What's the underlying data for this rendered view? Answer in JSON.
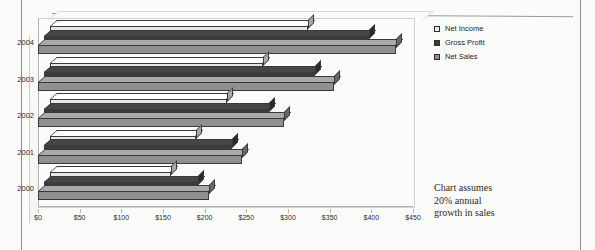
{
  "page": {
    "background_color": "#fbfbfa",
    "border_color": "#8a8a8a"
  },
  "note": {
    "line1": "Chart assumes",
    "line2": "20% annual",
    "line3": "growth in sales"
  },
  "legend": {
    "position": "top-right",
    "items": [
      {
        "label": "Net Income",
        "color": "#e8e8e8"
      },
      {
        "label": "Gross Profit",
        "color": "#3b3b3b"
      },
      {
        "label": "Net Sales",
        "color": "#8f8f8f"
      }
    ]
  },
  "chart_data": {
    "type": "bar",
    "orientation": "horizontal",
    "style": "3d",
    "title": "",
    "subtitle": "",
    "xlabel": "",
    "ylabel": "",
    "categories": [
      "2000",
      "2001",
      "2002",
      "2003",
      "2004"
    ],
    "series": [
      {
        "name": "Net Income",
        "color": "#e8e8e8",
        "values": [
          145,
          175,
          212,
          255,
          310
        ]
      },
      {
        "name": "Gross Profit",
        "color": "#3b3b3b",
        "values": [
          185,
          225,
          270,
          325,
          390
        ]
      },
      {
        "name": "Net Sales",
        "color": "#8f8f8f",
        "values": [
          205,
          245,
          295,
          355,
          430
        ]
      }
    ],
    "xlim": [
      0,
      450
    ],
    "xtick_values": [
      0,
      50,
      100,
      150,
      200,
      250,
      300,
      350,
      400,
      450
    ],
    "xtick_labels": [
      "$0",
      "$50",
      "$100",
      "$150",
      "$200",
      "$250",
      "$300",
      "$350",
      "$400",
      "$450"
    ],
    "grid": false,
    "annotations": [
      "Chart assumes 20% annual growth in sales"
    ]
  }
}
